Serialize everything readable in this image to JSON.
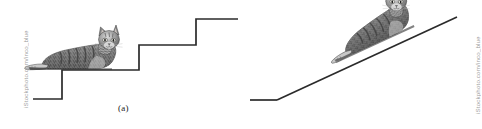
{
  "figure": {
    "type": "two-panel-illustration",
    "background_color": "#ffffff",
    "line_color": "#2b2b2b",
    "width": 482,
    "height": 129
  },
  "panels": [
    {
      "id": "a",
      "caption": "(a)",
      "subject": "cat-lying-on-staircase",
      "surface": "staircase",
      "description": "Grayscale tabby cat lying on the tread of a staircase with three rising steps",
      "geometry": {
        "polyline_label": "staircase-profile",
        "points": "33,99 62,99 62,70 139,70 139,45 196,45 196,19 238,19"
      }
    },
    {
      "id": "b",
      "caption": "(b)",
      "subject": "cat-lying-on-inclined-ramp",
      "surface": "inclined-plane",
      "description": "Same grayscale tabby cat lying on a straight inclined ramp rising to the right",
      "geometry": {
        "ground_label": "ground-segment",
        "ground_points": "250,100 277,100",
        "ramp_label": "ramp-line",
        "ramp_points": "277,100 457,17"
      }
    }
  ],
  "watermarks": {
    "left": "iStockphoto.com/inco_blue",
    "right": "iStockphoto.com/inco_blue",
    "color": "#9a9a9a"
  },
  "cat": {
    "name": "tabby-cat",
    "coat": "gray tabby, striped",
    "pose": "lying down, front paws extended forward, head up",
    "colors": {
      "body_dark": "#4a4a4a",
      "body_mid": "#7d7d7d",
      "body_light": "#b9b9b9",
      "highlight": "#e2e2e2",
      "outline": "#2f2f2f"
    }
  }
}
